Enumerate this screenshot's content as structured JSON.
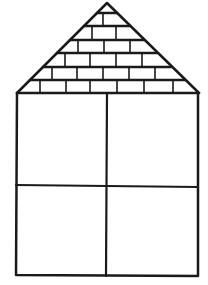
{
  "figure": {
    "stroke_color": "#1a1a1a",
    "background": "#ffffff"
  },
  "roof": {
    "apex": [
      107,
      3
    ],
    "base_left": [
      17,
      93
    ],
    "base_right": [
      199,
      93
    ],
    "brick_row_lines_y": [
      13,
      26,
      40,
      53,
      67,
      80,
      93
    ],
    "row_count": 7
  },
  "body": {
    "left": 16,
    "top": 93,
    "right": 198,
    "bottom": 275,
    "divider_x": 107,
    "divider_y": 186,
    "panes": [
      "top-left",
      "top-right",
      "bottom-left",
      "bottom-right"
    ]
  }
}
